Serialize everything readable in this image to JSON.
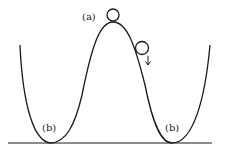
{
  "diagram": {
    "type": "potential-energy-curve",
    "labels": {
      "top": "(a)",
      "left_well": "(b)",
      "right_well": "(b)"
    },
    "elements": {
      "balls": [
        {
          "id": "ball-top",
          "position": "on peak (a)"
        },
        {
          "id": "ball-rolling",
          "position": "right slope, moving down"
        }
      ],
      "arrow": {
        "direction": "down"
      }
    },
    "colors": {
      "stroke": "#1a1a1a",
      "background": "#ffffff"
    }
  }
}
